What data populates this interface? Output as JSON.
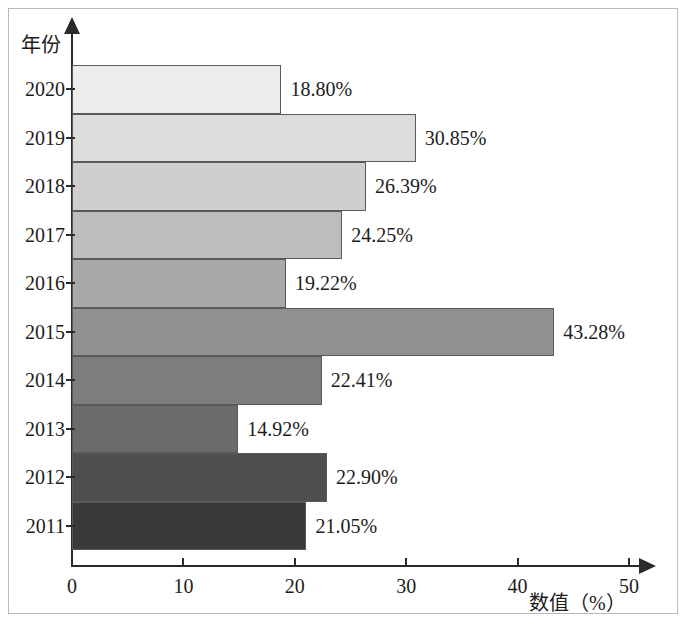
{
  "chart_data": {
    "type": "bar",
    "orientation": "horizontal",
    "title": "",
    "xlabel": "数值（%）",
    "ylabel": "年份",
    "categories": [
      "2020",
      "2019",
      "2018",
      "2017",
      "2016",
      "2015",
      "2014",
      "2013",
      "2012",
      "2011"
    ],
    "values": [
      18.8,
      30.85,
      26.39,
      24.25,
      19.22,
      43.28,
      22.41,
      14.92,
      22.9,
      21.05
    ],
    "value_labels": [
      "18.80%",
      "30.85%",
      "26.39%",
      "24.25%",
      "19.22%",
      "43.28%",
      "22.41%",
      "14.92%",
      "22.90%",
      "21.05%"
    ],
    "bar_colors": [
      "#ececec",
      "#dcdcdc",
      "#cfcfcf",
      "#bdbdbd",
      "#a9a9a9",
      "#919191",
      "#7d7d7d",
      "#6b6b6b",
      "#4f4f4f",
      "#3a3a3a"
    ],
    "xlim": [
      0,
      50
    ],
    "xticks": [
      0,
      10,
      20,
      30,
      40,
      50
    ],
    "xtick_labels": [
      "0",
      "10",
      "20",
      "30",
      "40",
      "50"
    ],
    "grid": false,
    "legend": false
  },
  "axes": {
    "y_title": "年份",
    "x_title": "数值（%）"
  }
}
